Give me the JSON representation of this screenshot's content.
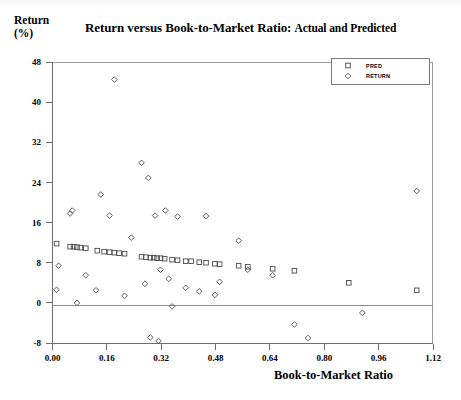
{
  "chart_data": {
    "type": "scatter",
    "title": "Return versus Book-to-Market Ratio:",
    "title_suffix": "Actual and Predicted",
    "ylabel_line1": "Return",
    "ylabel_line2": "(%)",
    "xlabel": "Book-to-Market Ratio",
    "xlim": [
      0.0,
      1.12
    ],
    "ylim": [
      -8,
      48
    ],
    "xticks": [
      "0.00",
      "0.16",
      "0.32",
      "0.48",
      "0.64",
      "0.80",
      "0.96",
      "1.12"
    ],
    "xtick_values": [
      0.0,
      0.16,
      0.32,
      0.48,
      0.64,
      0.8,
      0.96,
      1.12
    ],
    "yticks": [
      "48",
      "40",
      "32",
      "24",
      "16",
      "8",
      "0",
      "-8"
    ],
    "ytick_values": [
      48,
      40,
      32,
      24,
      16,
      8,
      0,
      -8
    ],
    "grid": false,
    "zero_line": true,
    "legend_position": "top-right",
    "marker_color": "#4a4a4a",
    "axis_color": "#6d6d6d",
    "series": [
      {
        "name": "PRED",
        "marker": "square",
        "points": [
          [
            0.012,
            11.8
          ],
          [
            0.052,
            11.2
          ],
          [
            0.062,
            11.2
          ],
          [
            0.072,
            11.1
          ],
          [
            0.082,
            11.0
          ],
          [
            0.098,
            10.9
          ],
          [
            0.132,
            10.4
          ],
          [
            0.152,
            10.2
          ],
          [
            0.168,
            10.1
          ],
          [
            0.182,
            10.0
          ],
          [
            0.196,
            9.9
          ],
          [
            0.212,
            9.8
          ],
          [
            0.262,
            9.2
          ],
          [
            0.275,
            9.1
          ],
          [
            0.288,
            9.0
          ],
          [
            0.298,
            9.0
          ],
          [
            0.308,
            8.9
          ],
          [
            0.318,
            8.9
          ],
          [
            0.33,
            8.8
          ],
          [
            0.352,
            8.6
          ],
          [
            0.368,
            8.5
          ],
          [
            0.392,
            8.3
          ],
          [
            0.408,
            8.3
          ],
          [
            0.432,
            8.1
          ],
          [
            0.452,
            8.0
          ],
          [
            0.478,
            7.8
          ],
          [
            0.492,
            7.7
          ],
          [
            0.548,
            7.4
          ],
          [
            0.575,
            7.2
          ],
          [
            0.648,
            6.8
          ],
          [
            0.712,
            6.4
          ],
          [
            0.872,
            4.0
          ],
          [
            1.072,
            2.5
          ]
        ]
      },
      {
        "name": "RETURN",
        "marker": "diamond",
        "points": [
          [
            0.012,
            2.6
          ],
          [
            0.018,
            7.4
          ],
          [
            0.052,
            17.8
          ],
          [
            0.058,
            18.4
          ],
          [
            0.072,
            0.0
          ],
          [
            0.098,
            5.5
          ],
          [
            0.128,
            2.5
          ],
          [
            0.142,
            21.6
          ],
          [
            0.168,
            17.4
          ],
          [
            0.182,
            44.5
          ],
          [
            0.212,
            1.4
          ],
          [
            0.232,
            13.0
          ],
          [
            0.262,
            27.9
          ],
          [
            0.272,
            3.8
          ],
          [
            0.282,
            24.9
          ],
          [
            0.288,
            -6.9
          ],
          [
            0.302,
            17.4
          ],
          [
            0.312,
            -7.6
          ],
          [
            0.318,
            6.6
          ],
          [
            0.332,
            18.4
          ],
          [
            0.342,
            4.8
          ],
          [
            0.352,
            -0.7
          ],
          [
            0.368,
            17.2
          ],
          [
            0.392,
            3.0
          ],
          [
            0.432,
            2.3
          ],
          [
            0.452,
            17.3
          ],
          [
            0.478,
            1.6
          ],
          [
            0.492,
            4.2
          ],
          [
            0.548,
            12.4
          ],
          [
            0.575,
            6.6
          ],
          [
            0.648,
            5.5
          ],
          [
            0.712,
            -4.3
          ],
          [
            0.752,
            -7.0
          ],
          [
            0.912,
            -2.0
          ],
          [
            1.072,
            22.3
          ]
        ]
      }
    ]
  },
  "legend": {
    "entries": [
      {
        "label": "PRED",
        "marker": "square"
      },
      {
        "label": "RETURN",
        "marker": "diamond"
      }
    ]
  }
}
